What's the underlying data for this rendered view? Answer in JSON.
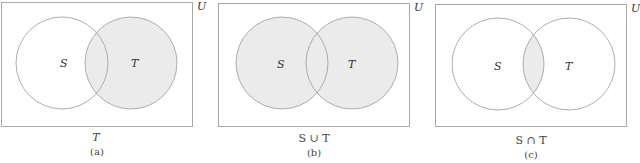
{
  "figure": {
    "colors": {
      "border": "#a8a8a8",
      "circle_stroke": "#9a9a9a",
      "shade": "#ebebeb",
      "background": "#ffffff"
    },
    "panels": [
      {
        "id": "a",
        "universe_label": "U",
        "set_labels": [
          "S",
          "T"
        ],
        "shaded": "T",
        "expression": "T",
        "caption": "(a)"
      },
      {
        "id": "b",
        "universe_label": "U",
        "set_labels": [
          "S",
          "T"
        ],
        "shaded": "S ∪ T",
        "expression": "S ∪ T",
        "caption": "(b)"
      },
      {
        "id": "c",
        "universe_label": "U",
        "set_labels": [
          "S",
          "T"
        ],
        "shaded": "S ∩ T",
        "expression": "S ∩ T",
        "caption": "(c)"
      }
    ]
  }
}
